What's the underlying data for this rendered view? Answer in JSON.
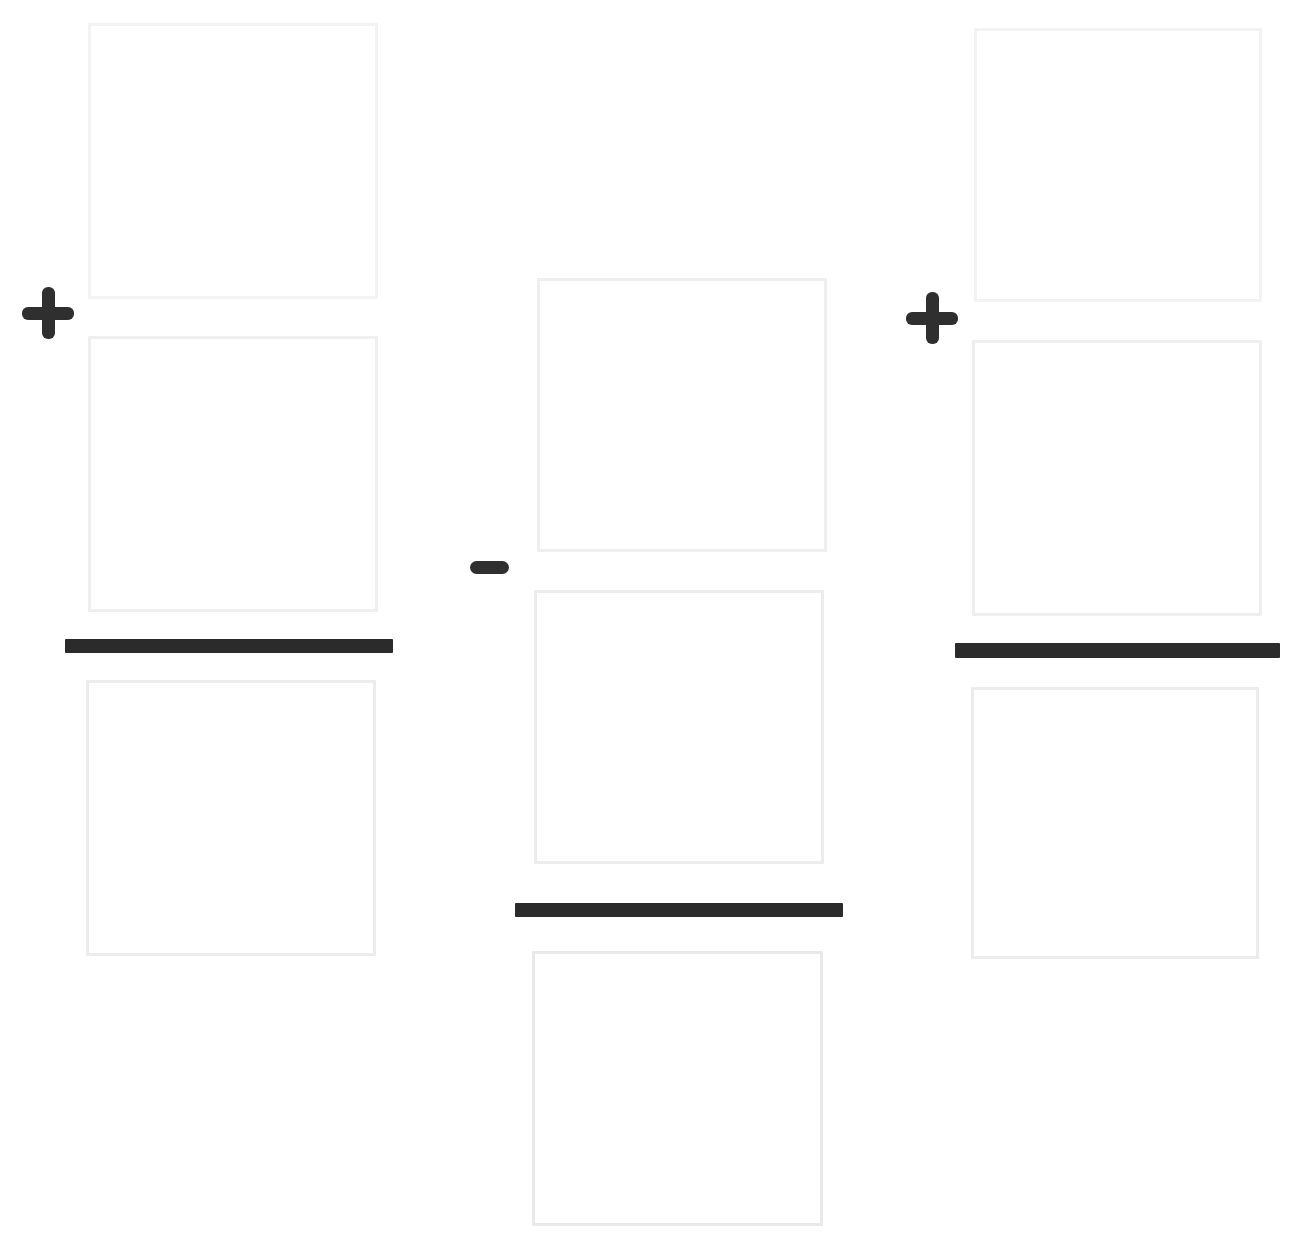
{
  "document": {
    "title": "Fraction Arithmetic Worksheet",
    "kind": "blank-fraction-expression-template",
    "background_color": "#ffffff",
    "width": 1302,
    "height": 1251
  },
  "palette": {
    "page_background": "#ffffff",
    "box_border": "#f1f1f1",
    "fraction_bar": "#2b2b2b",
    "operator": "#2f2f2f"
  },
  "expression": {
    "reading": "blank + blank - blank + blank",
    "term_count": 3,
    "operator_count": 3
  },
  "groups": [
    {
      "id": "group-left",
      "name": "left-fraction-group",
      "whole_box": {
        "name": "whole-number-box-left",
        "value": "",
        "placeholder": "",
        "x": 88,
        "y": 23,
        "w": 290,
        "h": 276
      },
      "numerator_box": {
        "name": "numerator-box-left",
        "value": "",
        "placeholder": "",
        "x": 88,
        "y": 336,
        "w": 290,
        "h": 276
      },
      "bar": {
        "name": "fraction-bar-left",
        "x": 65,
        "y": 639,
        "w": 328,
        "h": 14
      },
      "denominator_box": {
        "name": "denominator-box-left",
        "value": "",
        "placeholder": "",
        "x": 86,
        "y": 680,
        "w": 290,
        "h": 276
      }
    },
    {
      "id": "group-middle",
      "name": "middle-fraction-group",
      "whole_box": {
        "name": "whole-number-box-middle",
        "value": "",
        "placeholder": "",
        "x": 537,
        "y": 278,
        "w": 290,
        "h": 274
      },
      "numerator_box": {
        "name": "numerator-box-middle",
        "value": "",
        "placeholder": "",
        "x": 534,
        "y": 590,
        "w": 290,
        "h": 274
      },
      "bar": {
        "name": "fraction-bar-middle",
        "x": 515,
        "y": 903,
        "w": 328,
        "h": 14
      },
      "denominator_box": {
        "name": "denominator-box-middle",
        "value": "",
        "placeholder": "",
        "x": 532,
        "y": 951,
        "w": 291,
        "h": 275
      }
    },
    {
      "id": "group-right",
      "name": "right-fraction-group",
      "whole_box": {
        "name": "whole-number-box-right",
        "value": "",
        "placeholder": "",
        "x": 974,
        "y": 28,
        "w": 288,
        "h": 274
      },
      "numerator_box": {
        "name": "numerator-box-right",
        "value": "",
        "placeholder": "",
        "x": 972,
        "y": 340,
        "w": 290,
        "h": 276
      },
      "bar": {
        "name": "fraction-bar-right",
        "x": 955,
        "y": 643,
        "w": 325,
        "h": 15
      },
      "denominator_box": {
        "name": "denominator-box-right",
        "value": "",
        "placeholder": "",
        "x": 971,
        "y": 687,
        "w": 288,
        "h": 272
      }
    }
  ],
  "operators": [
    {
      "id": "op-1",
      "name": "plus-icon",
      "symbol": "+",
      "glyph": "plus",
      "x": 22,
      "y": 287,
      "size": 52
    },
    {
      "id": "op-2",
      "name": "minus-icon",
      "symbol": "−",
      "glyph": "minus",
      "x": 470,
      "y": 560,
      "w": 39,
      "h": 14
    },
    {
      "id": "op-3",
      "name": "plus-icon",
      "symbol": "+",
      "glyph": "plus",
      "x": 906,
      "y": 292,
      "size": 52
    }
  ]
}
